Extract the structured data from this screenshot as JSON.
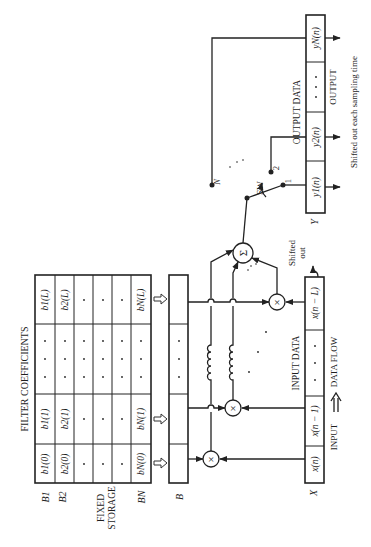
{
  "figure": {
    "orientation": "rotated-90-ccw",
    "title": "FILTER COEFFICIENTS",
    "fixed_storage_label": "FIXED STORAGE",
    "coeff_table": {
      "row_labels": [
        "B1",
        "B2",
        "",
        "",
        "",
        "BN"
      ],
      "columns": [
        "(0)",
        "(1)",
        "...",
        "(L)"
      ],
      "rows": [
        [
          "b1(0)",
          "b1(1)",
          "· · ·",
          "b1(L)"
        ],
        [
          "b2(0)",
          "b2(1)",
          "· · ·",
          "b2(L)"
        ],
        [
          "·",
          "·",
          "· · ·",
          "·"
        ],
        [
          "·",
          "·",
          "· · ·",
          "·"
        ],
        [
          "·",
          "·",
          "· · ·",
          "·"
        ],
        [
          "bN(0)",
          "bN(1)",
          "· · ·",
          "bN(L)"
        ]
      ]
    },
    "b_register_label": "B",
    "b_register_cells": [
      "",
      "",
      "· · ·",
      ""
    ],
    "multiplier_symbol": "×",
    "adder_symbol": "Σ",
    "switch_label": "SW",
    "switch_contacts": [
      "1",
      "2",
      "N"
    ],
    "input": {
      "register_label": "X",
      "title": "INPUT DATA",
      "cells": [
        "x(n)",
        "x(n − 1)",
        "· · ·",
        "x(n − L)"
      ],
      "flow_label": "INPUT ⟹ DATA FLOW",
      "flow_left": "INPUT",
      "flow_right": "DATA FLOW",
      "shifted_out": "Shifted out"
    },
    "output": {
      "register_label": "Y",
      "title": "OUTPUT DATA",
      "cells": [
        "y1(n)",
        "y2(n)",
        "· · ·",
        "yN(n)"
      ],
      "label": "OUTPUT",
      "note": "Shifted out each sampling time"
    }
  }
}
